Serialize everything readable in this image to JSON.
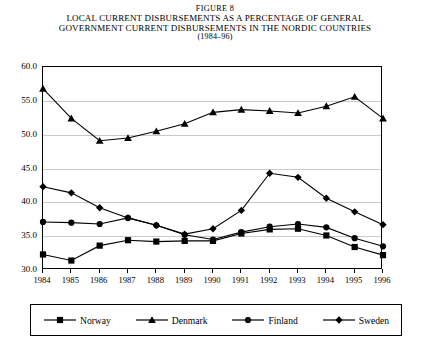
{
  "figure": {
    "figure_label": "FIGURE 8",
    "title_line1": "LOCAL CURRENT DISBURSEMENTS AS A PERCENTAGE OF GENERAL",
    "title_line2": "GOVERNMENT CURRENT DISBURSEMENTS IN THE NORDIC COUNTRIES",
    "subtitle": "(1984–96)"
  },
  "chart_data": {
    "type": "line",
    "title": "LOCAL CURRENT DISBURSEMENTS AS A PERCENTAGE OF GENERAL GOVERNMENT CURRENT DISBURSEMENTS IN THE NORDIC COUNTRIES",
    "subtitle": "(1984–96)",
    "xlabel": "",
    "ylabel": "",
    "x": [
      1984,
      1985,
      1986,
      1987,
      1988,
      1989,
      1990,
      1991,
      1992,
      1993,
      1994,
      1995,
      1996
    ],
    "categories": [
      "1984",
      "1985",
      "1986",
      "1987",
      "1988",
      "1989",
      "1990",
      "1991",
      "1992",
      "1993",
      "1994",
      "1995",
      "1996"
    ],
    "xlim": [
      1984,
      1996
    ],
    "ylim": [
      30.0,
      60.0
    ],
    "yticks": [
      "30.0",
      "35.0",
      "40.0",
      "45.0",
      "50.0",
      "55.0",
      "60.0"
    ],
    "ytick_values": [
      30.0,
      35.0,
      40.0,
      45.0,
      50.0,
      55.0,
      60.0
    ],
    "grid": true,
    "legend_position": "bottom",
    "series": [
      {
        "name": "Norway",
        "marker": "square",
        "values": [
          32.3,
          31.4,
          33.6,
          34.4,
          34.2,
          34.3,
          34.3,
          35.4,
          36.0,
          36.1,
          35.1,
          33.4,
          32.2
        ]
      },
      {
        "name": "Denmark",
        "marker": "triangle",
        "values": [
          56.8,
          52.4,
          49.1,
          49.5,
          50.5,
          51.6,
          53.3,
          53.7,
          53.5,
          53.2,
          54.2,
          55.6,
          52.4
        ]
      },
      {
        "name": "Finland",
        "marker": "circle",
        "values": [
          37.1,
          37.0,
          36.8,
          37.7,
          36.6,
          35.2,
          34.5,
          35.6,
          36.4,
          36.8,
          36.3,
          34.7,
          33.5
        ]
      },
      {
        "name": "Sweden",
        "marker": "diamond",
        "values": [
          42.3,
          41.4,
          39.2,
          37.7,
          36.6,
          35.3,
          36.1,
          38.8,
          44.3,
          43.7,
          40.6,
          38.6,
          36.7
        ]
      }
    ]
  },
  "legend": {
    "items": [
      {
        "label": "Norway",
        "marker": "square"
      },
      {
        "label": "Denmark",
        "marker": "triangle"
      },
      {
        "label": "Finland",
        "marker": "circle"
      },
      {
        "label": "Sweden",
        "marker": "diamond"
      }
    ]
  },
  "colors": {
    "line": "#000000",
    "grid": "#c9c9c9",
    "axis": "#000000",
    "background": "#ffffff"
  }
}
